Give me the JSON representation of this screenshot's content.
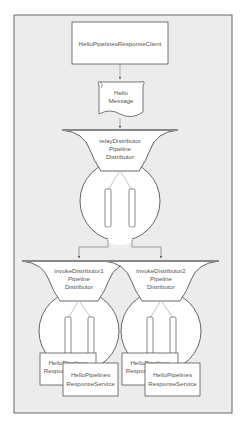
{
  "diagram": {
    "client": {
      "label": "HelloPipelinesResponseClient"
    },
    "message": {
      "line1": "Hello",
      "line2": "Message"
    },
    "relay": {
      "line1": "relayDistributor",
      "line2": "Pipeline",
      "line3": "Distributor"
    },
    "invokers": [
      {
        "line1": "invokeDistributor1",
        "line2": "Pipeline",
        "line3": "Distributor"
      },
      {
        "line1": "invokeDistributor2",
        "line2": "Pipeline",
        "line3": "Distributor"
      }
    ],
    "services": [
      {
        "line1": "HelloPipelines",
        "line2": "ResponseService"
      },
      {
        "line1": "HelloPipelines",
        "line2": "ResponseService"
      },
      {
        "line1": "HelloPipelines",
        "line2": "ResponseService"
      },
      {
        "line1": "HelloPipelines",
        "line2": "ResponseService"
      }
    ]
  },
  "colors": {
    "frame_bg": "#ececec",
    "stroke": "#555555",
    "fill": "#ffffff"
  }
}
